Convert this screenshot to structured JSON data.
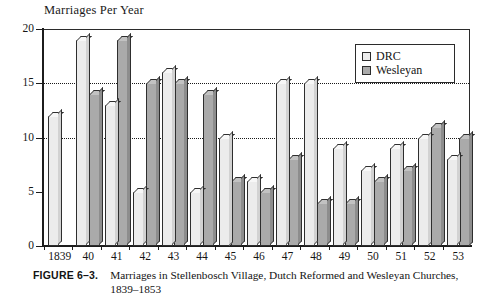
{
  "chart_data": {
    "type": "bar",
    "title": "Marriages Per Year",
    "xlabel": "",
    "ylabel": "Marriages Per Year",
    "ylim": [
      0,
      20
    ],
    "yticks": [
      0,
      5,
      10,
      15,
      20
    ],
    "gridlines": [
      10,
      15
    ],
    "grid": true,
    "legend_position": "top-right",
    "categories": [
      "1839",
      "40",
      "41",
      "42",
      "43",
      "44",
      "45",
      "46",
      "47",
      "48",
      "49",
      "50",
      "51",
      "52",
      "53"
    ],
    "series": [
      {
        "name": "DRC",
        "color": "#ececec",
        "values": [
          12,
          19,
          13,
          5,
          16,
          5,
          10,
          6,
          15,
          15,
          9,
          7,
          9,
          10,
          8
        ]
      },
      {
        "name": "Wesleyan",
        "color": "#aaaaaa",
        "values": [
          0,
          14,
          19,
          15,
          15,
          14,
          6,
          5,
          8,
          4,
          4,
          6,
          7,
          11,
          10
        ]
      }
    ]
  },
  "legend": {
    "entries": [
      {
        "label": "DRC"
      },
      {
        "label": "Wesleyan"
      }
    ]
  },
  "caption": {
    "figure_number": "FIGURE 6–3.",
    "text": "Marriages in Stellenbosch Village, Dutch Reformed and Wesleyan Churches, 1839–1853"
  },
  "colors": {
    "drc": "#ececec",
    "wesleyan": "#aaaaaa",
    "axis": "#1c1c1c",
    "text": "#141414"
  }
}
